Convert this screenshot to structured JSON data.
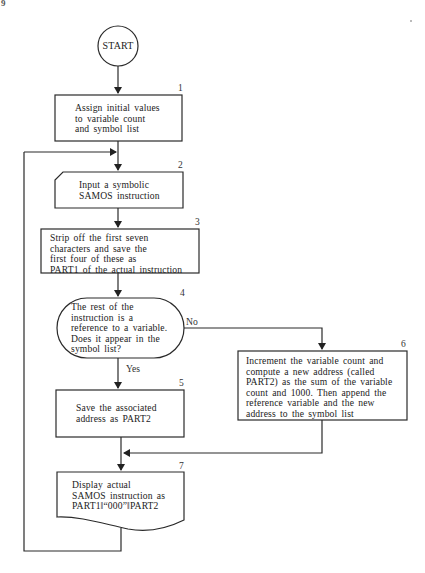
{
  "page": {
    "corner_mark": "9"
  },
  "flowchart": {
    "start": {
      "label": "START",
      "shape": "circle"
    },
    "nodes": [
      {
        "id": "1",
        "number": "1",
        "shape": "process",
        "text": "Assign initial values\nto variable count\nand symbol list"
      },
      {
        "id": "2",
        "number": "2",
        "shape": "manual-input",
        "text": "Input a symbolic\nSAMOS instruction"
      },
      {
        "id": "3",
        "number": "3",
        "shape": "process",
        "text": "Strip off the first seven\ncharacters and save the\nfirst four of these as\nPART1 of the actual instruction"
      },
      {
        "id": "4",
        "number": "4",
        "shape": "decision",
        "text": "The rest of the\ninstruction is a\nreference to a variable.\nDoes it appear in the\nsymbol list?"
      },
      {
        "id": "5",
        "number": "5",
        "shape": "process",
        "text": "Save the associated\naddress as PART2"
      },
      {
        "id": "6",
        "number": "6",
        "shape": "process",
        "text": "Increment the variable count and\ncompute a new address (called\nPART2) as the sum of the variable\ncount and 1000. Then append the\nreference variable and the new\naddress to the symbol list"
      },
      {
        "id": "7",
        "number": "7",
        "shape": "document",
        "text": "Display actual\nSAMOS instruction as\nPART1‖“000”‖PART2"
      }
    ],
    "edges": [
      {
        "from": "start",
        "to": "1",
        "label": ""
      },
      {
        "from": "1",
        "to": "2",
        "label": ""
      },
      {
        "from": "2",
        "to": "3",
        "label": ""
      },
      {
        "from": "3",
        "to": "4",
        "label": ""
      },
      {
        "from": "4",
        "to": "5",
        "label": "Yes"
      },
      {
        "from": "4",
        "to": "6",
        "label": "No"
      },
      {
        "from": "5",
        "to": "7",
        "label": ""
      },
      {
        "from": "6",
        "to": "7",
        "label": ""
      },
      {
        "from": "7",
        "to": "2",
        "label": "loop"
      }
    ],
    "labels": {
      "yes": "Yes",
      "no": "No"
    }
  }
}
